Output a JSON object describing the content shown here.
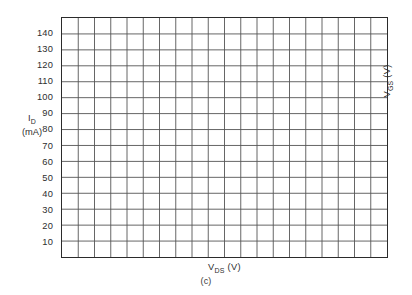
{
  "figure": {
    "caption": "(c)",
    "background_color": "#ffffff"
  },
  "axes": {
    "y_title_symbol": "I",
    "y_title_sub": "D",
    "y_title_units": "(mA)",
    "x_title_symbol": "V",
    "x_title_sub": "DS",
    "x_title_units": "(V)",
    "right_title_symbol": "V",
    "right_title_sub": "GS",
    "right_title_units": "(V)"
  },
  "chart_data": {
    "type": "line",
    "title": "",
    "subtitle": "",
    "annotations": [
      "(c)"
    ],
    "xlabel": "V_DS (V)",
    "ylabel": "I_D (mA)",
    "secondary_ylabel": "V_GS (V)",
    "xlim": [
      0,
      20
    ],
    "ylim": [
      0,
      150
    ],
    "x_tick_labels": [],
    "y_tick_labels": [
      "10",
      "20",
      "30",
      "40",
      "50",
      "60",
      "70",
      "80",
      "90",
      "100",
      "110",
      "120",
      "130",
      "140"
    ],
    "y_tick_values": [
      10,
      20,
      30,
      40,
      50,
      60,
      70,
      80,
      90,
      100,
      110,
      120,
      130,
      140
    ],
    "y_major_step": 10,
    "x_major_step": 1,
    "x_grid_columns": 20,
    "y_grid_rows": 15,
    "grid": true,
    "grid_color": "#555555",
    "border_color": "#2b2b2b",
    "legend": [],
    "legend_position": "none",
    "series": [],
    "values": [],
    "categories": [],
    "note": "Blank graph template (no plotted curves)"
  }
}
